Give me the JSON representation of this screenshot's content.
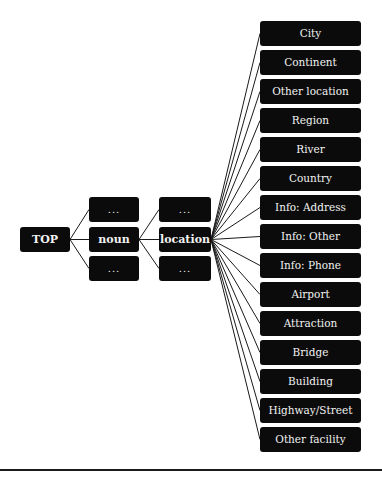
{
  "diagram": {
    "root": {
      "label": "TOP",
      "x": 20,
      "y": 227,
      "w": 50,
      "h": 25
    },
    "level1": [
      {
        "label": "...",
        "x": 89,
        "y": 197,
        "w": 50,
        "h": 25
      },
      {
        "label": "noun",
        "x": 89,
        "y": 227,
        "w": 50,
        "h": 25
      },
      {
        "label": "...",
        "x": 89,
        "y": 256,
        "w": 50,
        "h": 25
      }
    ],
    "level2": [
      {
        "label": "...",
        "x": 159,
        "y": 197,
        "w": 52,
        "h": 25
      },
      {
        "label": "location",
        "x": 159,
        "y": 227,
        "w": 52,
        "h": 25
      },
      {
        "label": "...",
        "x": 159,
        "y": 256,
        "w": 52,
        "h": 25
      }
    ],
    "leaves": [
      {
        "label": "City"
      },
      {
        "label": "Continent"
      },
      {
        "label": "Other location"
      },
      {
        "label": "Region"
      },
      {
        "label": "River"
      },
      {
        "label": "Country"
      },
      {
        "label": "Info: Address"
      },
      {
        "label": "Info: Other"
      },
      {
        "label": "Info: Phone"
      },
      {
        "label": "Airport"
      },
      {
        "label": "Attraction"
      },
      {
        "label": "Bridge"
      },
      {
        "label": "Building"
      },
      {
        "label": "Highway/Street"
      },
      {
        "label": "Other facility"
      }
    ],
    "leaf_layout": {
      "x": 260,
      "y0": 21,
      "pitch": 29,
      "w": 101,
      "h": 25
    },
    "colors": {
      "node_bg": "#0b0b0b",
      "node_text": "#f2f2f2",
      "edge": "#1a1a1a"
    }
  }
}
